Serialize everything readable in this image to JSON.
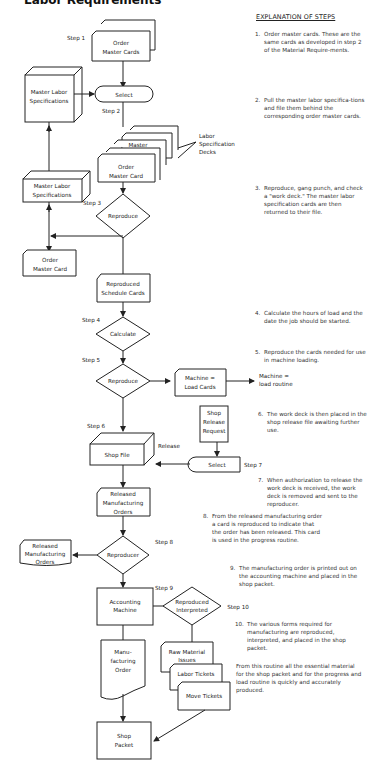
{
  "title": "Labor Requirements",
  "explanation": {
    "heading": "EXPLANATION OF STEPS",
    "steps": [
      {
        "num": "1.",
        "text": "Order master cards. These are the same cards as developed in step 2 of the Material Require-ments."
      },
      {
        "num": "2.",
        "text": "Pull the master labor specifica-tions and file them behind the corresponding order master cards."
      },
      {
        "num": "3.",
        "text": "Reproduce, gang punch, and check a \"work deck.\" The master labor specification cards are then returned to their file."
      },
      {
        "num": "4.",
        "text": "Calculate the hours of load and the date the job should be started."
      },
      {
        "num": "5.",
        "text": "Reproduce the cards needed for use in machine loading."
      },
      {
        "num": "6.",
        "text": "The work deck is then placed in the shop release file awaiting further use."
      },
      {
        "num": "7.",
        "text": "When authorization to release the work deck is received, the work deck is removed and sent to the reproducer."
      },
      {
        "num": "8.",
        "text": "From the released manufacturing order a card is reproduced to indicate that the order has been released. This card is used in the progress routine."
      },
      {
        "num": "9.",
        "text": "The manufacturing order is printed out on the accounting machine and placed in the shop packet."
      },
      {
        "num": "10.",
        "text": "The various forms required for manufacturing are reproduced, interpreted, and placed in the shop packet."
      }
    ],
    "closing": "From this routine all the essential material for the shop packet and for the progress and load routine is quickly and accurately produced."
  },
  "diagram": {
    "step_labels": {
      "s1": "Step 1",
      "s2": "Step 2",
      "s3": "Step 3",
      "s4": "Step 4",
      "s5": "Step 5",
      "s6": "Step 6",
      "s7": "Step 7",
      "s8": "Step 8",
      "s9": "Step 9",
      "s10": "Step 10"
    },
    "nodes": {
      "order_master_cards_1": "Order",
      "order_master_cards_2": "Master Cards",
      "master_labor_spec_top_1": "Master Labor",
      "master_labor_spec_top_2": "Specifications",
      "select_1": "Select",
      "master": "Master",
      "labor_spec_decks_1": "Labor",
      "labor_spec_decks_2": "Specification",
      "labor_spec_decks_3": "Decks",
      "order_master_card_1": "Order",
      "order_master_card_2": "Master Card",
      "master_labor_spec_bot_1": "Master Labor",
      "master_labor_spec_bot_2": "Specifications",
      "reproduce_1": "Reproduce",
      "order_master_card_out_1": "Order",
      "order_master_card_out_2": "Master Card",
      "reproduced_schedule_1": "Reproduced",
      "reproduced_schedule_2": "Schedule Cards",
      "calculate": "Calculate",
      "reproduce_2": "Reproduce",
      "machine_load_cards_1": "Machine =",
      "machine_load_cards_2": "Load Cards",
      "machine_load_routine_1": "Machine =",
      "machine_load_routine_2": "load routine",
      "shop_release_request_1": "Shop",
      "shop_release_request_2": "Release",
      "shop_release_request_3": "Request",
      "shop_file": "Shop File",
      "release": "Release",
      "select_2": "Select",
      "released_mfg_orders_1": "Released",
      "released_mfg_orders_2": "Manufacturing",
      "released_mfg_orders_3": "Orders",
      "reproducer": "Reproducer",
      "released_mfg_orders_left_1": "Released",
      "released_mfg_orders_left_2": "Manufacturing",
      "released_mfg_orders_left_3": "Orders",
      "accounting_machine_1": "Accounting",
      "accounting_machine_2": "Machine",
      "reproduced_interpreted_1": "Reproduced",
      "reproduced_interpreted_2": "Interpreted",
      "mfg_order_1": "Manu-",
      "mfg_order_2": "facturing",
      "mfg_order_3": "Order",
      "raw_material_issues_1": "Raw Material",
      "raw_material_issues_2": "Issues",
      "labor_tickets": "Labor Tickets",
      "move_tickets": "Move Tickets",
      "shop_packet_1": "Shop",
      "shop_packet_2": "Packet"
    }
  }
}
